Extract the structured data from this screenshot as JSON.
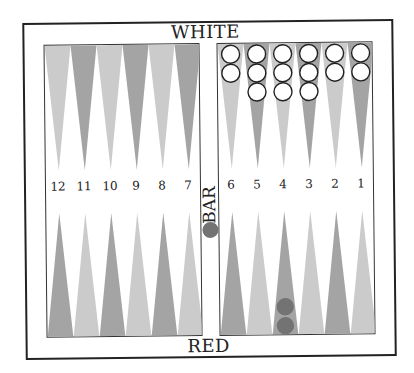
{
  "board": {
    "top_label": "WHITE",
    "bottom_label": "RED",
    "bar_label": "BAR",
    "colors": {
      "point_light": "#cbcbcb",
      "point_dark": "#a4a4a4",
      "white_checker_fill": "#ffffff",
      "white_checker_stroke": "#222222",
      "red_checker_fill": "#737373",
      "frame": "#222222"
    },
    "point_numbers_left": [
      "12",
      "11",
      "10",
      "9",
      "8",
      "7"
    ],
    "point_numbers_right": [
      "6",
      "5",
      "4",
      "3",
      "2",
      "1"
    ],
    "top_left_points": [
      {
        "shade": "light",
        "white": 0,
        "red": 0
      },
      {
        "shade": "dark",
        "white": 0,
        "red": 0
      },
      {
        "shade": "light",
        "white": 0,
        "red": 0
      },
      {
        "shade": "dark",
        "white": 0,
        "red": 0
      },
      {
        "shade": "light",
        "white": 0,
        "red": 0
      },
      {
        "shade": "dark",
        "white": 0,
        "red": 0
      }
    ],
    "top_right_points": [
      {
        "shade": "light",
        "white": 2,
        "red": 0
      },
      {
        "shade": "dark",
        "white": 3,
        "red": 0
      },
      {
        "shade": "light",
        "white": 3,
        "red": 0
      },
      {
        "shade": "dark",
        "white": 3,
        "red": 0
      },
      {
        "shade": "light",
        "white": 2,
        "red": 0
      },
      {
        "shade": "dark",
        "white": 2,
        "red": 0
      }
    ],
    "bottom_left_points": [
      {
        "point": "12",
        "shade": "dark",
        "white": 0,
        "red": 0
      },
      {
        "point": "11",
        "shade": "light",
        "white": 0,
        "red": 0
      },
      {
        "point": "10",
        "shade": "dark",
        "white": 0,
        "red": 0
      },
      {
        "point": "9",
        "shade": "light",
        "white": 0,
        "red": 0
      },
      {
        "point": "8",
        "shade": "dark",
        "white": 0,
        "red": 0
      },
      {
        "point": "7",
        "shade": "light",
        "white": 0,
        "red": 0
      }
    ],
    "bottom_right_points": [
      {
        "point": "6",
        "shade": "dark",
        "white": 0,
        "red": 0
      },
      {
        "point": "5",
        "shade": "light",
        "white": 0,
        "red": 0
      },
      {
        "point": "4",
        "shade": "dark",
        "white": 0,
        "red": 2
      },
      {
        "point": "3",
        "shade": "light",
        "white": 0,
        "red": 0
      },
      {
        "point": "2",
        "shade": "dark",
        "white": 0,
        "red": 0
      },
      {
        "point": "1",
        "shade": "light",
        "white": 0,
        "red": 0
      }
    ],
    "bar": {
      "red": 1,
      "white": 0
    }
  }
}
